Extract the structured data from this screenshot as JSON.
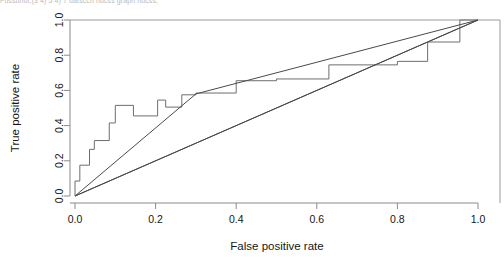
{
  "header": {
    "clipped_text": "Fussunut,(3 4) 5 4) 7 uatsccn nucss graph nucss,"
  },
  "chart_data": {
    "type": "line",
    "title": "",
    "xlabel": "False positive rate",
    "ylabel": "True positive rate",
    "xlim": [
      0,
      1
    ],
    "ylim": [
      0,
      1
    ],
    "grid": false,
    "legend_position": "none",
    "xticks": [
      "0.0",
      "0.2",
      "0.4",
      "0.6",
      "0.8",
      "1.0"
    ],
    "xtick_values": [
      0,
      0.2,
      0.4,
      0.6,
      0.8,
      1.0
    ],
    "yticks": [
      "0.0",
      "0.2",
      "0.4",
      "0.6",
      "0.8",
      "1.0"
    ],
    "ytick_values": [
      0,
      0.2,
      0.4,
      0.6,
      0.8,
      1.0
    ],
    "series": [
      {
        "name": "ROC step curve",
        "style": "step",
        "color": "#6e6e6e",
        "x": [
          0.0,
          0.0,
          0.012,
          0.012,
          0.036,
          0.036,
          0.048,
          0.048,
          0.085,
          0.085,
          0.1,
          0.1,
          0.145,
          0.145,
          0.205,
          0.205,
          0.225,
          0.225,
          0.265,
          0.265,
          0.3,
          0.3,
          0.4,
          0.4,
          0.5,
          0.5,
          0.63,
          0.63,
          0.8,
          0.8,
          0.875,
          0.875,
          0.955,
          0.955,
          1.0
        ],
        "y": [
          0.0,
          0.085,
          0.085,
          0.175,
          0.175,
          0.265,
          0.265,
          0.315,
          0.315,
          0.415,
          0.415,
          0.515,
          0.515,
          0.455,
          0.455,
          0.545,
          0.545,
          0.505,
          0.505,
          0.575,
          0.575,
          0.585,
          0.585,
          0.655,
          0.655,
          0.665,
          0.665,
          0.745,
          0.745,
          0.765,
          0.765,
          0.875,
          0.875,
          1.0,
          1.0
        ]
      },
      {
        "name": "Fitted ROC line",
        "style": "straight",
        "color": "#4a4a4a",
        "x": [
          0.0,
          1.0
        ],
        "y": [
          0.0,
          1.0
        ],
        "note": "upper straight chord from origin to (1,1), passing near TPR 0.58 at FPR 0.30"
      },
      {
        "name": "Chance diagonal",
        "style": "straight",
        "color": "#4a4a4a",
        "x": [
          0.0,
          1.0
        ],
        "y": [
          0.0,
          1.0
        ]
      }
    ],
    "annotations": []
  }
}
